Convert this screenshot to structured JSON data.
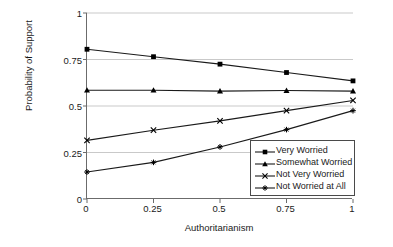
{
  "chart_data": {
    "type": "line",
    "title": "",
    "xlabel": "Authoritarianism",
    "ylabel": "Probability of Support",
    "x": [
      0,
      0.25,
      0.5,
      0.75,
      1
    ],
    "xtick_labels": [
      "0",
      "0.25",
      "0.5",
      "0.75",
      "1"
    ],
    "ytick_labels": [
      "0",
      "0.25",
      "0.5",
      "0.75",
      "1"
    ],
    "xlim": [
      0,
      1
    ],
    "ylim": [
      0,
      1
    ],
    "grid": "horizontal",
    "legend_position": "lower-right-inside",
    "series": [
      {
        "name": "Very Worried",
        "marker": "square",
        "values": [
          0.805,
          0.765,
          0.725,
          0.68,
          0.635
        ]
      },
      {
        "name": "Somewhat Worried",
        "marker": "triangle",
        "values": [
          0.585,
          0.585,
          0.58,
          0.583,
          0.58
        ]
      },
      {
        "name": "Not Very Worried",
        "marker": "x",
        "values": [
          0.315,
          0.37,
          0.42,
          0.475,
          0.53
        ]
      },
      {
        "name": "Not Worried at All",
        "marker": "plus",
        "values": [
          0.145,
          0.197,
          0.28,
          0.373,
          0.475
        ]
      }
    ],
    "colors": {
      "line": "#1a1a1a",
      "marker": "#000000",
      "grid": "#c9c9c9",
      "axis": "#6b6b6b",
      "background": "#ffffff"
    }
  },
  "legend": {
    "items": [
      {
        "label": "Very Worried"
      },
      {
        "label": "Somewhat Worried"
      },
      {
        "label": "Not Very Worried"
      },
      {
        "label": "Not Worried at All"
      }
    ]
  }
}
